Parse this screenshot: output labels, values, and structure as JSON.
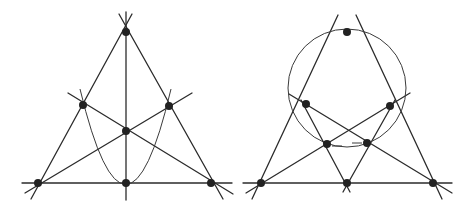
{
  "figures": [
    {
      "name": "left-figure",
      "description": "Triangle with three cevians through a common point and a parabola through midpoints",
      "lines": [
        {
          "x1": 132,
          "y1": 14,
          "x2": 31,
          "y2": 199
        },
        {
          "x1": 119,
          "y1": 14,
          "x2": 223,
          "y2": 199
        },
        {
          "x1": 22,
          "y1": 183,
          "x2": 232,
          "y2": 183
        },
        {
          "x1": 126,
          "y1": 12,
          "x2": 126,
          "y2": 200
        },
        {
          "x1": 25,
          "y1": 193,
          "x2": 192,
          "y2": 93
        },
        {
          "x1": 68,
          "y1": 93,
          "x2": 233,
          "y2": 194
        }
      ],
      "curves": [
        {
          "type": "parabola",
          "d": "M80 89 Q126 280 171 89"
        }
      ],
      "points": [
        {
          "x": 126,
          "y": 32
        },
        {
          "x": 83,
          "y": 105
        },
        {
          "x": 169,
          "y": 106
        },
        {
          "x": 126,
          "y": 131
        },
        {
          "x": 38,
          "y": 183
        },
        {
          "x": 126,
          "y": 183
        },
        {
          "x": 211,
          "y": 183
        }
      ]
    },
    {
      "name": "right-figure",
      "description": "Triangle with a circle through the apex, cevians and inner intersection points",
      "lines": [
        {
          "x1": 338,
          "y1": 15,
          "x2": 252,
          "y2": 199
        },
        {
          "x1": 356,
          "y1": 15,
          "x2": 442,
          "y2": 199
        },
        {
          "x1": 243,
          "y1": 183,
          "x2": 452,
          "y2": 183
        },
        {
          "x1": 289,
          "y1": 94,
          "x2": 452,
          "y2": 193
        },
        {
          "x1": 410,
          "y1": 93,
          "x2": 246,
          "y2": 193
        },
        {
          "x1": 301,
          "y1": 100,
          "x2": 350,
          "y2": 192
        },
        {
          "x1": 395,
          "y1": 100,
          "x2": 343,
          "y2": 192
        }
      ],
      "circle": {
        "cx": 347,
        "cy": 88,
        "r": 59
      },
      "ticks": [
        {
          "x1": 332,
          "y1": 146,
          "x2": 342,
          "y2": 146
        },
        {
          "x1": 352,
          "y1": 143,
          "x2": 362,
          "y2": 143
        }
      ],
      "points": [
        {
          "x": 347,
          "y": 32
        },
        {
          "x": 306,
          "y": 104
        },
        {
          "x": 390,
          "y": 106
        },
        {
          "x": 327,
          "y": 144
        },
        {
          "x": 367,
          "y": 143
        },
        {
          "x": 261,
          "y": 183
        },
        {
          "x": 347,
          "y": 183
        },
        {
          "x": 433,
          "y": 183
        }
      ]
    }
  ],
  "style": {
    "line_color": "#2b2b2b",
    "point_color": "#222222",
    "background": "#ffffff",
    "point_radius": 4
  }
}
